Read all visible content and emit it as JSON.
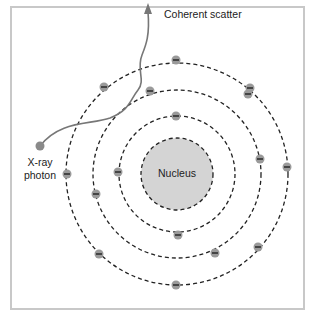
{
  "diagram": {
    "title": "Coherent scatter",
    "labels": {
      "scatter": "Coherent scatter",
      "photon_line1": "X-ray",
      "photon_line2": "photon",
      "nucleus": "Nucleus"
    },
    "colors": {
      "frame": "#c8c8c8",
      "nucleus_fill": "#d4d4d4",
      "electron_fill": "#9a9a9a",
      "photon_path": "#777777",
      "orbit": "#222222"
    },
    "center": [
      177,
      174
    ],
    "nucleus_radius": 36,
    "orbits": [
      58,
      84,
      111
    ],
    "electrons": [
      {
        "orbit": 1,
        "x": 176,
        "y": 116
      },
      {
        "orbit": 1,
        "x": 118,
        "y": 172
      },
      {
        "orbit": 1,
        "x": 178,
        "y": 235
      },
      {
        "orbit": 1,
        "x": 260,
        "y": 159
      },
      {
        "orbit": 2,
        "x": 150,
        "y": 91
      },
      {
        "orbit": 2,
        "x": 96,
        "y": 194
      },
      {
        "orbit": 2,
        "x": 215,
        "y": 253
      },
      {
        "orbit": 2,
        "x": 248,
        "y": 94
      },
      {
        "orbit": 3,
        "x": 104,
        "y": 87
      },
      {
        "orbit": 3,
        "x": 176,
        "y": 60
      },
      {
        "orbit": 3,
        "x": 250,
        "y": 88
      },
      {
        "orbit": 3,
        "x": 287,
        "y": 167
      },
      {
        "orbit": 3,
        "x": 258,
        "y": 247
      },
      {
        "orbit": 3,
        "x": 176,
        "y": 285
      },
      {
        "orbit": 3,
        "x": 99,
        "y": 254
      },
      {
        "orbit": 3,
        "x": 67,
        "y": 174
      }
    ]
  }
}
